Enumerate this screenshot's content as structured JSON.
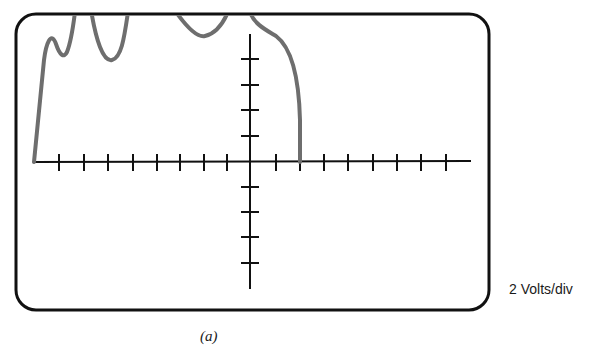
{
  "figure": {
    "caption": "(a)",
    "scale_label": "2 Volts/div"
  },
  "colors": {
    "frame": "#111111",
    "axes": "#111111",
    "trace": "#6e6e6e",
    "text": "#1a1a1a"
  },
  "screen": {
    "x": 16,
    "y": 14,
    "width": 473,
    "height": 296,
    "corner_radius": 20
  },
  "graticule": {
    "origin_x": 250,
    "origin_y": 162,
    "h_axis": {
      "x1": 33,
      "x2": 471
    },
    "v_axis": {
      "y1": 34,
      "y2": 289
    },
    "h_ticks_x": [
      59,
      84,
      108,
      133,
      157,
      180,
      204,
      227,
      276,
      300,
      324,
      348,
      373,
      397,
      421,
      446
    ],
    "v_ticks_y": [
      59,
      85,
      110,
      136,
      187,
      212,
      237,
      263
    ]
  },
  "chart_data": {
    "type": "line",
    "title": "",
    "xlabel": "",
    "ylabel": "",
    "scale": "2 Volts/div",
    "caption": "(a)",
    "grid": false,
    "x_divisions": [
      -9,
      -8,
      -7,
      -6,
      -5,
      -4,
      -3,
      -2,
      -1,
      0,
      1,
      2,
      3,
      4,
      5,
      6,
      7,
      8,
      9
    ],
    "trace_points_div": [
      {
        "x": -8.9,
        "y": 0.0
      },
      {
        "x": -8.4,
        "y": 3.6
      },
      {
        "x": -8.1,
        "y": 4.1
      },
      {
        "x": -7.6,
        "y": 3.9
      },
      {
        "x": -7.2,
        "y": 5.0
      },
      {
        "x": -6.4,
        "y": 5.0
      },
      {
        "x": -5.9,
        "y": 3.9
      },
      {
        "x": -5.1,
        "y": 5.0
      },
      {
        "x": -3.1,
        "y": 5.0
      },
      {
        "x": -2.4,
        "y": 4.5
      },
      {
        "x": -1.0,
        "y": 5.0
      },
      {
        "x": 0.0,
        "y": 5.0
      },
      {
        "x": 1.0,
        "y": 4.2
      },
      {
        "x": 1.8,
        "y": 2.6
      },
      {
        "x": 2.0,
        "y": 0.0
      }
    ]
  }
}
